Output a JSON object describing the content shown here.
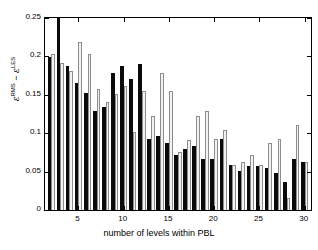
{
  "chart_data": {
    "type": "bar",
    "title": "",
    "subtitle": "",
    "xlabel": "number of levels within PBL",
    "ylabel": "εRMS − εLES",
    "ylabel_parts": {
      "eps1": "ε",
      "sup1": "RMS",
      "minus": " − ",
      "eps2": "ε",
      "sup2": "LES"
    },
    "xlim": [
      1.3,
      30.7
    ],
    "ylim": [
      0,
      0.25
    ],
    "grid": false,
    "legend": "none",
    "xticks": [
      5,
      10,
      15,
      20,
      25,
      30
    ],
    "yticks": [
      0,
      0.05,
      0.1,
      0.15,
      0.2,
      0.25
    ],
    "ytick_labels": [
      "0",
      "0.05",
      "0.1",
      "0.15",
      "0.2",
      "0.25"
    ],
    "xtick_labels": [
      "5",
      "10",
      "15",
      "20",
      "25",
      "30"
    ],
    "categories": [
      2,
      3,
      4,
      5,
      6,
      7,
      8,
      9,
      10,
      11,
      12,
      13,
      14,
      15,
      16,
      17,
      18,
      19,
      20,
      21,
      22,
      23,
      24,
      25,
      26,
      27,
      28,
      29,
      30
    ],
    "series": [
      {
        "name": "dark",
        "color": "#0a0a0a",
        "values": [
          0.199,
          0.276,
          0.188,
          0.165,
          0.153,
          0.129,
          0.134,
          0.178,
          0.188,
          0.17,
          0.19,
          0.093,
          0.097,
          0.087,
          0.072,
          0.08,
          0.084,
          0.067,
          0.066,
          0.093,
          0.058,
          0.051,
          0.057,
          0.057,
          0.055,
          0.048,
          0.037,
          0.066,
          0.063
        ]
      },
      {
        "name": "light",
        "color": "#f2f2f2",
        "edge_color": "#8d8d8d",
        "values": [
          0.203,
          0.191,
          0.181,
          0.219,
          0.203,
          0.158,
          0.141,
          0.151,
          0.162,
          0.102,
          0.155,
          0.122,
          0.178,
          0.155,
          0.076,
          0.091,
          0.122,
          0.129,
          0.093,
          0.104,
          0.059,
          0.062,
          0.071,
          0.058,
          0.087,
          0.093,
          0.015,
          0.111,
          0.063
        ]
      }
    ]
  }
}
